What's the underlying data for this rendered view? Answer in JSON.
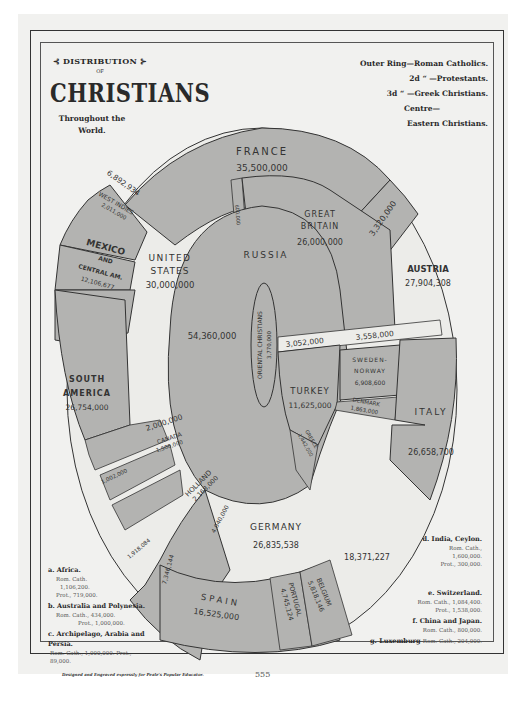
{
  "title": {
    "line1": "⊰ DISTRIBUTION ⊱",
    "line2": "OF",
    "line3": "CHRISTIANS",
    "subtitle": "Throughout the World."
  },
  "legend": [
    {
      "key": "Outer Ring",
      "value": "—Roman Catholics."
    },
    {
      "key": "2d  “",
      "value": "—Protestants."
    },
    {
      "key": "3d  “",
      "value": "—Greek Christians."
    },
    {
      "key": "Centre—",
      "value": ""
    },
    {
      "key": "",
      "value": "Eastern Christians."
    }
  ],
  "colors": {
    "shaded": "#b3b3b1",
    "light": "#ecece9",
    "paper": "#f1f1ef",
    "line": "#333333"
  },
  "segments": {
    "france": {
      "name": "FRANCE",
      "value": "35,500,000"
    },
    "france_b": {
      "value": "3,320,000"
    },
    "small_600": {
      "value": "600,000"
    },
    "great_britain": {
      "name1": "GREAT",
      "name2": "BRITAIN",
      "value": "26,000,000"
    },
    "austria": {
      "name": "AUSTRIA",
      "value": "27,904,308"
    },
    "us_protestant": {
      "value": "6,892,934"
    },
    "west_indies": {
      "name": "WEST INDIES",
      "value": "2,011,000"
    },
    "mexico": {
      "name1": "MEXICO",
      "name2": "AND",
      "name3": "CENTRAL AM.",
      "value": "12,106,677"
    },
    "united_states": {
      "name1": "UNITED",
      "name2": "STATES",
      "value": "30,000,000"
    },
    "russia": {
      "name": "RUSSIA",
      "value": "54,360,000"
    },
    "oriental": {
      "name": "ORIENTAL CHRISTIANS",
      "value": "3,770,000"
    },
    "austria_greek": {
      "value": "3,052,000"
    },
    "austria_3558": {
      "value": "3,558,000"
    },
    "sweden": {
      "name1": "SWEDEN-",
      "name2": "NORWAY",
      "value": "6,908,600"
    },
    "denmark": {
      "name": "DENMARK",
      "value": "1,863,000"
    },
    "turkey": {
      "name": "TURKEY",
      "value": "11,625,000",
      "small": "50,000"
    },
    "italy": {
      "name": "ITALY",
      "value": "26,658,700",
      "small": "960,000"
    },
    "greece": {
      "name": "GREECE",
      "value": "1,442,000"
    },
    "south_america": {
      "name1": "SOUTH",
      "name2": "AMERICA",
      "value": "26,754,000"
    },
    "sa_protestant": {
      "value": "2,000,000"
    },
    "canada": {
      "name": "CANADA",
      "value": "1,500,000"
    },
    "small_1": {
      "value": "1,002,000"
    },
    "holland": {
      "name": "HOLLAND",
      "value": "2,168,000"
    },
    "small_2": {
      "value": "1,918,084"
    },
    "germany_rc_edge": {
      "value": "4,040,000"
    },
    "germany_side": {
      "value": "7,346,144"
    },
    "germany": {
      "name": "GERMANY",
      "value": "26,835,538"
    },
    "germany_prot": {
      "value": "18,371,227"
    },
    "spain": {
      "name": "SPAIN",
      "value": "16,525,000"
    },
    "portugal": {
      "name": "PORTUGAL",
      "value": "4,745,124"
    },
    "belgium": {
      "name": "BELGIUM",
      "value": "5,818,146"
    },
    "letters": [
      "a",
      "b",
      "c",
      "d",
      "e",
      "f",
      "g"
    ]
  },
  "notes_left": [
    {
      "label": "a. Africa.",
      "lines": [
        "Rom. Cath.",
        "1,106,200.",
        "Prot., 719,000."
      ]
    },
    {
      "label": "b. Australia and Polynesia.",
      "lines": [
        "Rom. Cath., 434,000.",
        "Prot., 1,000,000."
      ]
    },
    {
      "label": "c. Archipelago, Arabia and Persia.",
      "lines": [
        "Rom. Cath., 1,000,000.  Prot., 89,000."
      ]
    }
  ],
  "notes_right": [
    {
      "label": "d. India, Ceylon.",
      "lines": [
        "Rom. Cath.,",
        "1,600,000.",
        "Prot., 300,000."
      ]
    },
    {
      "label": "e. Switzerland.",
      "lines": [
        "Rom. Cath., 1,084,400.",
        "Prot., 1,538,000."
      ]
    },
    {
      "label": "f. China and Japan.",
      "lines": [
        "Rom. Cath., 800,000."
      ]
    },
    {
      "label": "g. Luxemburg",
      "lines": [
        "Rom. Cath., 204,000."
      ]
    }
  ],
  "footer": {
    "credit": "Designed and Engraved expressly for Peale's Popular Educator.",
    "page_number": "555"
  }
}
